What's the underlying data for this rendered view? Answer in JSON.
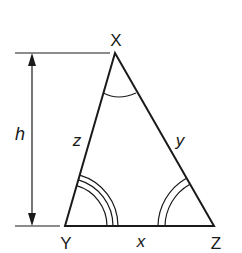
{
  "diagram": {
    "type": "triangle-with-height",
    "vertices": [
      {
        "name": "X",
        "label": "X",
        "x": 115,
        "y": 53
      },
      {
        "name": "Y",
        "label": "Y",
        "x": 65,
        "y": 226
      },
      {
        "name": "Z",
        "label": "Z",
        "x": 214,
        "y": 226
      }
    ],
    "sides": [
      {
        "name": "x",
        "label": "x",
        "from": "Y",
        "to": "Z"
      },
      {
        "name": "y",
        "label": "y",
        "from": "X",
        "to": "Z"
      },
      {
        "name": "z",
        "label": "z",
        "from": "X",
        "to": "Y"
      }
    ],
    "angle_marks": {
      "X": 1,
      "Y": 3,
      "Z": 2
    },
    "height": {
      "label": "h"
    },
    "colors": {
      "stroke": "#1a1a1a",
      "background": "#ffffff"
    }
  }
}
